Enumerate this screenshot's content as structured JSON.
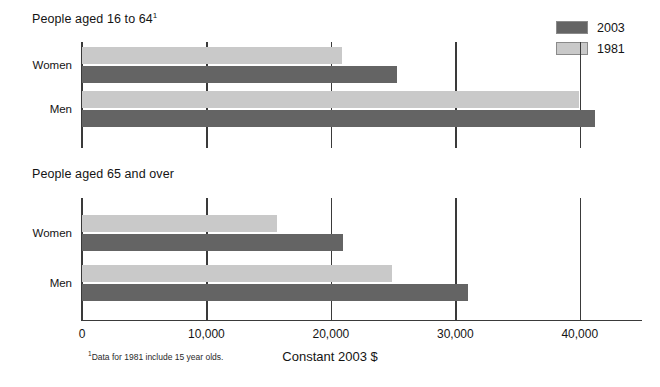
{
  "chart_data": {
    "type": "bar",
    "orientation": "horizontal",
    "title": "",
    "xlabel": "Constant 2003 $",
    "ylabel": "",
    "xlim": [
      0,
      45000
    ],
    "xticks": [
      0,
      10000,
      20000,
      30000,
      40000
    ],
    "xtick_labels": [
      "0",
      "10,000",
      "20,000",
      "30,000",
      "40,000"
    ],
    "grid": true,
    "legend_position": "top-right",
    "legend": [
      "2003",
      "1981"
    ],
    "colors": {
      "2003": "#646464",
      "1981": "#c9c9c9",
      "axis": "#3a3a3a"
    },
    "footnote": "Data for 1981 include 15 year olds.",
    "footnote_marker": "1",
    "panels": [
      {
        "title": "People aged 16 to 64",
        "title_superscript": "1",
        "categories": [
          "Women",
          "Men"
        ],
        "series": [
          {
            "name": "2003",
            "values": [
              25300,
              41200
            ]
          },
          {
            "name": "1981",
            "values": [
              20900,
              39900
            ]
          }
        ]
      },
      {
        "title": "People aged 65 and over",
        "title_superscript": "",
        "categories": [
          "Women",
          "Men"
        ],
        "series": [
          {
            "name": "2003",
            "values": [
              21000,
              31000
            ]
          },
          {
            "name": "1981",
            "values": [
              15700,
              24900
            ]
          }
        ]
      }
    ]
  }
}
